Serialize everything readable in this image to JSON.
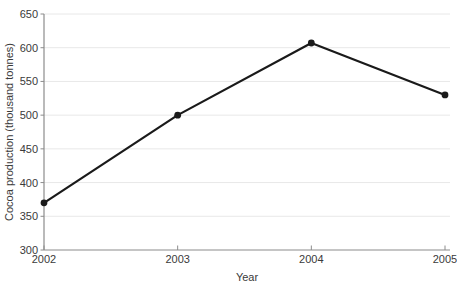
{
  "chart_data": {
    "type": "line",
    "x": [
      "2002",
      "2003",
      "2004",
      "2005"
    ],
    "series": [
      {
        "name": "Cocoa production",
        "values": [
          370,
          500,
          607,
          530
        ]
      }
    ],
    "title": "",
    "xlabel": "Year",
    "ylabel": "Cocoa production (thousand tonnes)",
    "ylim": [
      300,
      650
    ],
    "ytick_step": 50,
    "yticks": [
      300,
      350,
      400,
      450,
      500,
      550,
      600,
      650
    ],
    "grid": "horizontal",
    "legend_position": "none",
    "line_color": "#1a1a1a",
    "marker": "filled-circle",
    "grid_color": "#e8e8e8",
    "axis_color": "#8c8c8c",
    "text_color": "#3a3a3a"
  }
}
